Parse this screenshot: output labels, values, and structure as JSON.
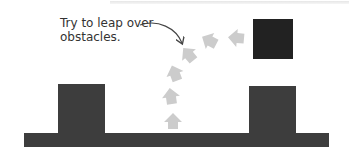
{
  "caption": {
    "line1": "Try to leap over",
    "line2": "obstacles."
  },
  "colors": {
    "obstacle": "#3d3d3d",
    "floating_block": "#222222",
    "jump_arrow": "#cccccc",
    "pointer_arrow": "#444444",
    "background": "#ffffff"
  },
  "elements": {
    "ground": "ground-platform",
    "obstacles": [
      "left-obstacle",
      "right-obstacle"
    ],
    "floating_block": "floating-target-block",
    "jump_path_arrows": 7,
    "pointer": "curved-pointer-arrow"
  }
}
